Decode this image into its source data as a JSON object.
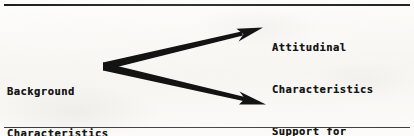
{
  "figure": {
    "background_color": "#fbfaf8",
    "ink_color": "#161616",
    "rules": {
      "top_label": "top-horizontal-rule",
      "bottom_label": "bottom-horizontal-rule"
    }
  },
  "nodes": {
    "source": {
      "line1": "Background",
      "line2": "Characteristics"
    },
    "outcome_1": {
      "line1": "Attitudinal",
      "line2": "Characteristics"
    },
    "outcome_2": {
      "line1": "Support for",
      "line2": "Actions of Dissent"
    }
  },
  "arrows": [
    {
      "name": "arrow-to-attitudinal-characteristics",
      "from": "Background Characteristics",
      "to": "Attitudinal Characteristics",
      "direction": "up-right"
    },
    {
      "name": "arrow-to-support-for-actions-of-dissent",
      "from": "Background Characteristics",
      "to": "Support for Actions of Dissent",
      "direction": "down-right"
    }
  ]
}
